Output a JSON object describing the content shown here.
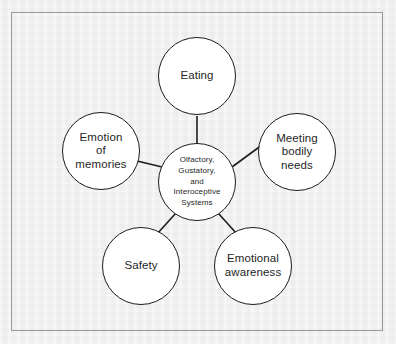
{
  "figure": {
    "kind": "hub-and-spoke-circle-diagram",
    "frame_border_color": "#9a9a9a",
    "background_color": "#eeeeee",
    "node_outline_color": "#1c1c1c",
    "node_fill_color": "#ffffff",
    "connector_color": "#1c1c1c"
  },
  "hub": {
    "id": "olfactory-gustatory-interoceptive-systems",
    "label": "Olfactory,\nGustatory,\nand\nInteroceptive\nSystems"
  },
  "satellites": [
    {
      "id": "eating",
      "label": "Eating",
      "position": "top"
    },
    {
      "id": "meeting-bodily-needs",
      "label": "Meeting\nbodily\nneeds",
      "position": "right"
    },
    {
      "id": "emotional-awareness",
      "label": "Emotional\nawareness",
      "position": "bottom-right"
    },
    {
      "id": "safety",
      "label": "Safety",
      "position": "bottom-left"
    },
    {
      "id": "emotion-of-memories",
      "label": "Emotion\nof\nmemories",
      "position": "left"
    }
  ],
  "connectors": [
    {
      "from": "hub",
      "to": "eating"
    },
    {
      "from": "hub",
      "to": "meeting-bodily-needs"
    },
    {
      "from": "hub",
      "to": "emotional-awareness"
    },
    {
      "from": "hub",
      "to": "safety"
    },
    {
      "from": "hub",
      "to": "emotion-of-memories"
    }
  ]
}
